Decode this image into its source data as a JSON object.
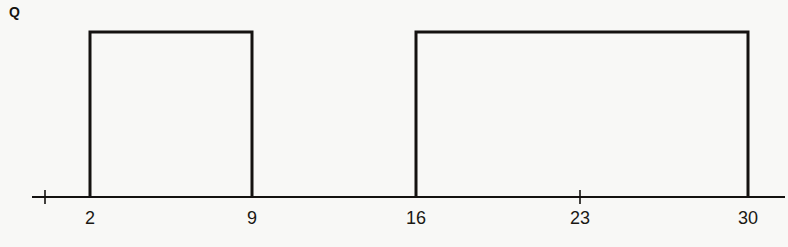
{
  "figure": {
    "signal_label": "Q",
    "background_color": "#f8f8f6",
    "stroke_color": "#141210",
    "width": 788,
    "height": 247
  },
  "axis": {
    "baseline_y": 197,
    "x_start": 32,
    "x_end": 785,
    "stroke_width": 2,
    "minor_tick_half_height": 7,
    "ticks": [
      {
        "name": "origin-tick",
        "x": 45,
        "label": "",
        "kind": "minor"
      },
      {
        "name": "tick-2",
        "x": 90,
        "label": "2",
        "kind": "edge"
      },
      {
        "name": "tick-9",
        "x": 252,
        "label": "9",
        "kind": "edge"
      },
      {
        "name": "tick-16",
        "x": 416,
        "label": "16",
        "kind": "edge"
      },
      {
        "name": "tick-23",
        "x": 580,
        "label": "23",
        "kind": "minor"
      },
      {
        "name": "tick-30",
        "x": 748,
        "label": "30",
        "kind": "edge"
      }
    ],
    "label_y": 209
  },
  "chart_data": {
    "type": "line",
    "title": "",
    "subtitle": "",
    "xlabel": "",
    "ylabel": "Q",
    "legend": [],
    "grid": false,
    "xlim": [
      0,
      32
    ],
    "ylim": [
      0,
      1
    ],
    "x_ticks": [
      2,
      9,
      16,
      23,
      30
    ],
    "x_tick_labels": [
      "2",
      "9",
      "16",
      "23",
      "30"
    ],
    "y_ticks": [],
    "y_tick_labels": [],
    "waveform_style": "digital-square-pulse",
    "series": [
      {
        "name": "Q",
        "x": [
          0,
          2,
          2,
          9,
          9,
          16,
          16,
          30,
          30,
          32
        ],
        "values": [
          0,
          0,
          1,
          1,
          0,
          0,
          1,
          1,
          0,
          0
        ]
      }
    ],
    "pulses": [
      {
        "name": "pulse-1",
        "rise_x": 2,
        "fall_x": 9,
        "level": 1,
        "width": 7
      },
      {
        "name": "pulse-2",
        "rise_x": 16,
        "fall_x": 30,
        "level": 1,
        "width": 14
      }
    ],
    "low_intervals": [
      {
        "from": 0,
        "to": 2
      },
      {
        "from": 9,
        "to": 16
      },
      {
        "from": 30,
        "to": 32
      }
    ],
    "annotations": [
      {
        "text": "Q",
        "role": "signal-name",
        "x": 0,
        "y": 1
      }
    ]
  },
  "geometry": {
    "pulse_top_y": 32,
    "pulse_stroke_width": 3,
    "pulses_px": [
      {
        "name": "pulse-1",
        "x_left": 90,
        "x_right": 252
      },
      {
        "name": "pulse-2",
        "x_left": 416,
        "x_right": 748
      }
    ]
  }
}
